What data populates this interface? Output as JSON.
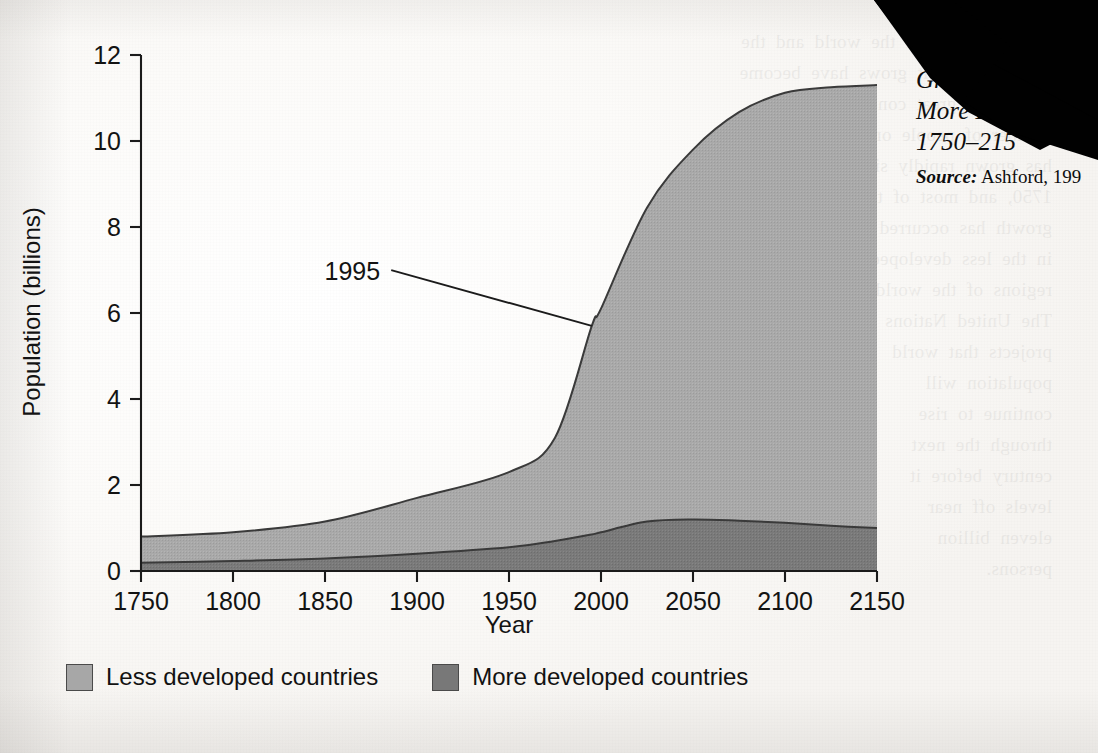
{
  "figure": {
    "caption_fig_number": "F",
    "caption_lines": [
      "Grow",
      "More De",
      "1750–215"
    ],
    "source_word": "Source:",
    "source_text": "Ashford, 199",
    "occlusion_note": "black-scan-artifact"
  },
  "legend": {
    "position": "below-axis-left",
    "items": [
      {
        "label": "Less developed countries",
        "color": "#a7a7a7"
      },
      {
        "label": "More developed countries",
        "color": "#787878"
      }
    ]
  },
  "showthrough_text": "the population of the world and the\nrate at which it grows have become\nmatters of great concern. The\nnumber of people on earth\nhas grown rapidly since\n1750, and most of that\ngrowth has occurred\nin the less developed\nregions of the world.\nThe United Nations\nprojects that world\npopulation will\ncontinue to rise\nthrough the next\ncentury before it\nlevels off near\neleven billion\npersons.",
  "chart_data": {
    "type": "area",
    "stacked": true,
    "xlabel": "Year",
    "ylabel": "Population (billions)",
    "xlim": [
      1750,
      2150
    ],
    "ylim": [
      0,
      12
    ],
    "xticks": [
      1750,
      1800,
      1850,
      1900,
      1950,
      2000,
      2050,
      2100,
      2150
    ],
    "yticks": [
      0,
      2,
      4,
      6,
      8,
      10,
      12
    ],
    "grid": false,
    "x": [
      1750,
      1800,
      1850,
      1900,
      1950,
      1975,
      1995,
      2000,
      2025,
      2050,
      2075,
      2100,
      2125,
      2150
    ],
    "series": [
      {
        "name": "More developed countries",
        "color": "#787878",
        "values": [
          0.19,
          0.23,
          0.29,
          0.4,
          0.55,
          0.7,
          0.85,
          0.9,
          1.15,
          1.2,
          1.17,
          1.12,
          1.05,
          1.0
        ]
      },
      {
        "name": "Less developed countries",
        "color": "#a7a7a7",
        "values": [
          0.61,
          0.67,
          0.86,
          1.3,
          1.75,
          2.4,
          4.85,
          5.2,
          7.3,
          8.6,
          9.5,
          10.0,
          10.2,
          10.3
        ]
      }
    ],
    "total_values": [
      0.8,
      0.9,
      1.15,
      1.7,
      2.3,
      3.1,
      5.7,
      6.1,
      8.45,
      9.8,
      10.67,
      11.12,
      11.25,
      11.3
    ],
    "annotations": [
      {
        "text": "1995",
        "x": 1995,
        "y_total": 5.7,
        "label_at": [
          1880,
          6.95
        ]
      }
    ]
  }
}
